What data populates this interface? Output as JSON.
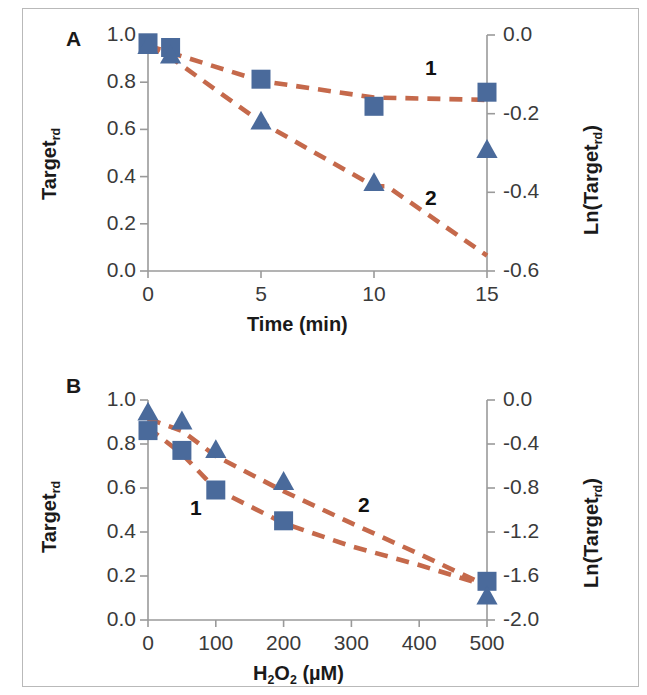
{
  "figure": {
    "background": "#ffffff",
    "border_color": "#b9b9b9",
    "marker_color": "#4A6A9B",
    "line_color": "#C5694B",
    "axis_color": "#9a9a9a",
    "text_color": "#262626"
  },
  "panels": [
    {
      "letter": "A",
      "chart_ref": 0
    },
    {
      "letter": "B",
      "chart_ref": 1
    }
  ],
  "chart_data": [
    {
      "type": "scatter",
      "panel": "A",
      "title": "",
      "xlabel": "Time (min)",
      "ylabel": "Target<sub>rd</sub>",
      "ylabel_plain": "Target_rd",
      "y2label": "Ln(Target<sub>rd</sub>)",
      "y2label_plain": "Ln(Target_rd)",
      "xlim": [
        0,
        15
      ],
      "ylim": [
        0.0,
        1.0
      ],
      "y2lim": [
        -0.6,
        0.0
      ],
      "xticks": [
        0,
        5,
        10,
        15
      ],
      "xticklabels": [
        "0",
        "5",
        "10",
        "15"
      ],
      "yticks": [
        0.0,
        0.2,
        0.4,
        0.6,
        0.8,
        1.0
      ],
      "yticklabels": [
        "0.0",
        "0.2",
        "0.4",
        "0.6",
        "0.8",
        "1.0"
      ],
      "y2ticks": [
        -0.6,
        -0.4,
        -0.2,
        0.0
      ],
      "y2ticklabels": [
        "-0.6",
        "-0.4",
        "-0.2",
        "0.0"
      ],
      "grid": false,
      "legend_position": "inline-annotation",
      "series": [
        {
          "name": "1",
          "marker": "square",
          "color": "#4A6A9B",
          "axis": "left",
          "annotation": "1",
          "annotation_xy": [
            12.2,
            0.86
          ],
          "x": [
            0,
            1,
            5,
            10,
            15
          ],
          "values": [
            0.965,
            0.945,
            0.81,
            0.695,
            0.755
          ]
        },
        {
          "name": "2",
          "marker": "triangle",
          "color": "#4A6A9B",
          "axis": "left",
          "annotation": "2",
          "annotation_xy": [
            12.2,
            0.38
          ],
          "x": [
            0,
            1,
            5,
            10,
            15
          ],
          "values": [
            0.955,
            0.915,
            0.635,
            0.375,
            0.515
          ]
        }
      ],
      "fit_lines": [
        {
          "for_series": "1",
          "style": "dashed",
          "color": "#C5694B",
          "points": [
            [
              0,
              0.955
            ],
            [
              1,
              0.925
            ],
            [
              5,
              0.805
            ],
            [
              10,
              0.735
            ],
            [
              15,
              0.725
            ]
          ]
        },
        {
          "for_series": "2",
          "style": "dashed",
          "color": "#C5694B",
          "points": [
            [
              0,
              0.955
            ],
            [
              1,
              0.905
            ],
            [
              5,
              0.63
            ],
            [
              10,
              0.36
            ],
            [
              15,
              0.065
            ]
          ]
        }
      ]
    },
    {
      "type": "scatter",
      "panel": "B",
      "title": "",
      "xlabel": "H<sub>2</sub>O<sub>2</sub> (&#181;M)",
      "xlabel_plain": "H2O2 (uM)",
      "ylabel": "Target<sub>rd</sub>",
      "ylabel_plain": "Target_rd",
      "y2label": "Ln(Target<sub>rd</sub>)",
      "y2label_plain": "Ln(Target_rd)",
      "xlim": [
        0,
        500
      ],
      "ylim": [
        0.0,
        1.0
      ],
      "y2lim": [
        -2.0,
        0.0
      ],
      "xticks": [
        0,
        100,
        200,
        300,
        400,
        500
      ],
      "xticklabels": [
        "0",
        "100",
        "200",
        "300",
        "400",
        "500"
      ],
      "yticks": [
        0.0,
        0.2,
        0.4,
        0.6,
        0.8,
        1.0
      ],
      "yticklabels": [
        "0.0",
        "0.2",
        "0.4",
        "0.6",
        "0.8",
        "1.0"
      ],
      "y2ticks": [
        -2.0,
        -1.6,
        -1.2,
        -0.8,
        -0.4,
        0.0
      ],
      "y2ticklabels": [
        "-2.0",
        "-1.6",
        "-1.2",
        "-0.8",
        "-0.4",
        "0.0"
      ],
      "grid": false,
      "legend_position": "inline-annotation",
      "series": [
        {
          "name": "1",
          "marker": "square",
          "color": "#4A6A9B",
          "axis": "left",
          "annotation": "1",
          "annotation_xy": [
            68,
            0.5
          ],
          "x": [
            0,
            50,
            100,
            200,
            500
          ],
          "values": [
            0.855,
            0.765,
            0.585,
            0.445,
            0.17
          ]
        },
        {
          "name": "2",
          "marker": "triangle",
          "color": "#4A6A9B",
          "axis": "left",
          "annotation": "2",
          "annotation_xy": [
            300,
            0.52
          ],
          "x": [
            0,
            50,
            100,
            200,
            500
          ],
          "values": [
            0.905,
            0.865,
            0.735,
            0.59,
            0.07
          ]
        }
      ],
      "fit_lines": [
        {
          "for_series": "1",
          "style": "dashed",
          "color": "#C5694B",
          "points": [
            [
              0,
              0.875
            ],
            [
              50,
              0.755
            ],
            [
              100,
              0.595
            ],
            [
              200,
              0.44
            ],
            [
              300,
              0.335
            ],
            [
              400,
              0.25
            ],
            [
              500,
              0.155
            ]
          ]
        },
        {
          "for_series": "2",
          "style": "dashed",
          "color": "#C5694B",
          "points": [
            [
              0,
              0.915
            ],
            [
              50,
              0.86
            ],
            [
              100,
              0.745
            ],
            [
              200,
              0.585
            ],
            [
              300,
              0.44
            ],
            [
              400,
              0.3
            ],
            [
              500,
              0.155
            ]
          ]
        }
      ]
    }
  ]
}
